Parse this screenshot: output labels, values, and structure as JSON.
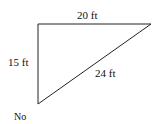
{
  "diagram": {
    "type": "right-triangle",
    "labels": {
      "top": "20 ft",
      "left": "15 ft",
      "hypotenuse": "24 ft",
      "answer": "No"
    },
    "vertices": {
      "top_left": [
        38,
        24
      ],
      "top_right": [
        151,
        24
      ],
      "bottom_left": [
        38,
        104
      ]
    },
    "stroke_color": "#222222"
  }
}
